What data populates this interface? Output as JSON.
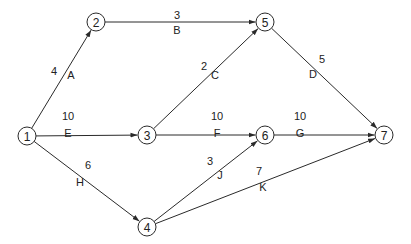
{
  "diagram": {
    "type": "activity-on-arrow network",
    "node_radius": 9,
    "colors": {
      "line": "#2a2a2a",
      "text": "#222222",
      "background": "#ffffff"
    },
    "nodes": [
      {
        "id": "1",
        "label": "1",
        "x": 27,
        "y": 136
      },
      {
        "id": "2",
        "label": "2",
        "x": 96,
        "y": 22
      },
      {
        "id": "3",
        "label": "3",
        "x": 147,
        "y": 135
      },
      {
        "id": "4",
        "label": "4",
        "x": 147,
        "y": 227
      },
      {
        "id": "5",
        "label": "5",
        "x": 265,
        "y": 22
      },
      {
        "id": "6",
        "label": "6",
        "x": 265,
        "y": 135
      },
      {
        "id": "7",
        "label": "7",
        "x": 384,
        "y": 135
      }
    ],
    "edges": [
      {
        "from": "1",
        "to": "2",
        "activity": "A",
        "duration": "4",
        "duration_pos": [
          54,
          71
        ],
        "activity_pos": [
          71,
          75
        ]
      },
      {
        "from": "2",
        "to": "5",
        "activity": "B",
        "duration": "3",
        "duration_pos": [
          177,
          15
        ],
        "activity_pos": [
          177,
          30
        ]
      },
      {
        "from": "3",
        "to": "5",
        "activity": "C",
        "duration": "2",
        "duration_pos": [
          204,
          66
        ],
        "activity_pos": [
          215,
          75
        ]
      },
      {
        "from": "5",
        "to": "7",
        "activity": "D",
        "duration": "5",
        "duration_pos": [
          322,
          59
        ],
        "activity_pos": [
          313,
          74
        ]
      },
      {
        "from": "1",
        "to": "3",
        "activity": "E",
        "duration": "10",
        "duration_pos": [
          68,
          116
        ],
        "activity_pos": [
          68,
          133
        ]
      },
      {
        "from": "3",
        "to": "6",
        "activity": "F",
        "duration": "10",
        "duration_pos": [
          217,
          116
        ],
        "activity_pos": [
          217,
          133
        ]
      },
      {
        "from": "6",
        "to": "7",
        "activity": "G",
        "duration": "10",
        "duration_pos": [
          300,
          116
        ],
        "activity_pos": [
          300,
          133
        ]
      },
      {
        "from": "1",
        "to": "4",
        "activity": "H",
        "duration": "6",
        "duration_pos": [
          88,
          165
        ],
        "activity_pos": [
          80,
          182
        ]
      },
      {
        "from": "4",
        "to": "6",
        "activity": "J",
        "duration": "3",
        "duration_pos": [
          210,
          161
        ],
        "activity_pos": [
          220,
          175
        ]
      },
      {
        "from": "4",
        "to": "7",
        "activity": "K",
        "duration": "7",
        "duration_pos": [
          259,
          171
        ],
        "activity_pos": [
          263,
          187
        ]
      }
    ]
  }
}
